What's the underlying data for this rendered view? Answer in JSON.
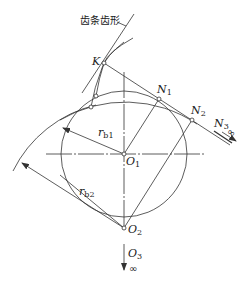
{
  "diagram": {
    "title_label": "齿条齿形",
    "points": {
      "K": "K",
      "N1": {
        "main": "N",
        "sub": "1"
      },
      "N2": {
        "main": "N",
        "sub": "2"
      },
      "N3": {
        "main": "N",
        "sub": "3"
      },
      "O1": {
        "main": "O",
        "sub": "1"
      },
      "O2": {
        "main": "O",
        "sub": "2"
      },
      "O3": {
        "main": "O",
        "sub": "3"
      }
    },
    "radii": {
      "rb1": {
        "main": "r",
        "sub": "b1"
      },
      "rb2": {
        "main": "r",
        "sub": "b2"
      }
    },
    "infinity_symbol": "∞",
    "colors": {
      "stroke": "#333333",
      "background": "#ffffff"
    }
  }
}
